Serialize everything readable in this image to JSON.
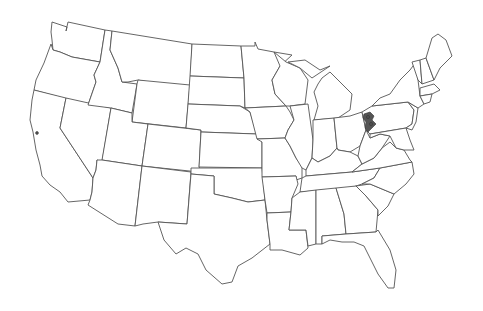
{
  "map": {
    "type": "us-states-outline",
    "background": "#ffffff",
    "line_color": "#555555",
    "highlight_color": "#555555",
    "highlights": [
      {
        "region": "western-pennsylvania",
        "kind": "county-cluster"
      },
      {
        "region": "san-francisco-bay-area",
        "kind": "small-mark"
      }
    ]
  }
}
